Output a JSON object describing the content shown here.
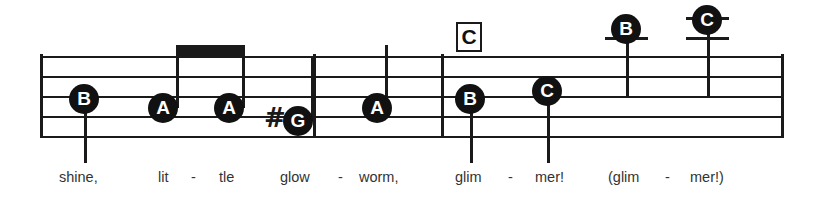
{
  "score": {
    "staff": {
      "left": 40,
      "right": 783,
      "line_ys": [
        56,
        76,
        96,
        116,
        136
      ],
      "line_color": "#1a1a1a"
    },
    "barlines": [
      {
        "name": "barline-start",
        "x": 40,
        "top": 54,
        "bottom": 138
      },
      {
        "name": "barline-1",
        "x": 313,
        "top": 54,
        "bottom": 138
      },
      {
        "name": "barline-2",
        "x": 441,
        "top": 54,
        "bottom": 138
      },
      {
        "name": "barline-end",
        "x": 781,
        "top": 54,
        "bottom": 138
      }
    ],
    "chord_symbols": [
      {
        "label": "C",
        "x": 456,
        "y": 22,
        "width": 26,
        "height": 30
      }
    ],
    "notes": [
      {
        "id": "note-1",
        "letter": "B",
        "head_x": 69,
        "head_y": 84,
        "stem_x": 84,
        "stem_top": 99,
        "stem_bottom": 163,
        "stem_dir": "down",
        "accidental": "",
        "ledger_lines": []
      },
      {
        "id": "note-2",
        "letter": "A",
        "head_x": 148,
        "head_y": 93,
        "stem_x": 176,
        "stem_top": 45,
        "stem_bottom": 108,
        "stem_dir": "up",
        "accidental": "",
        "ledger_lines": []
      },
      {
        "id": "note-3",
        "letter": "A",
        "head_x": 214,
        "head_y": 93,
        "stem_x": 242,
        "stem_top": 45,
        "stem_bottom": 108,
        "stem_dir": "up",
        "accidental": "",
        "ledger_lines": []
      },
      {
        "id": "note-4",
        "letter": "G",
        "head_x": 283,
        "head_y": 106,
        "stem_x": 311,
        "stem_top": 58,
        "stem_bottom": 121,
        "stem_dir": "up",
        "accidental": "#",
        "accidental_x": 264,
        "accidental_y": 105,
        "ledger_lines": []
      },
      {
        "id": "note-5",
        "letter": "A",
        "head_x": 362,
        "head_y": 93,
        "stem_x": 385,
        "stem_top": 45,
        "stem_bottom": 108,
        "stem_dir": "up",
        "accidental": "",
        "ledger_lines": []
      },
      {
        "id": "note-6",
        "letter": "B",
        "head_x": 455,
        "head_y": 84,
        "stem_x": 470,
        "stem_top": 99,
        "stem_bottom": 163,
        "stem_dir": "down",
        "accidental": "",
        "ledger_lines": []
      },
      {
        "id": "note-7",
        "letter": "C",
        "head_x": 532,
        "head_y": 76,
        "stem_x": 547,
        "stem_top": 91,
        "stem_bottom": 163,
        "stem_dir": "down",
        "accidental": "",
        "ledger_lines": []
      },
      {
        "id": "note-8",
        "letter": "B",
        "head_x": 611,
        "head_y": 14,
        "stem_x": 626,
        "stem_top": 29,
        "stem_bottom": 97,
        "stem_dir": "down",
        "accidental": "",
        "ledger_lines": [
          {
            "x": 605,
            "y": 37,
            "width": 43
          }
        ]
      },
      {
        "id": "note-9",
        "letter": "C",
        "head_x": 692,
        "head_y": 5,
        "stem_x": 707,
        "stem_top": 20,
        "stem_bottom": 97,
        "stem_dir": "down",
        "accidental": "",
        "ledger_lines": [
          {
            "x": 686,
            "y": 17,
            "width": 43
          },
          {
            "x": 686,
            "y": 37,
            "width": 43
          }
        ]
      }
    ],
    "beams": [
      {
        "x": 176,
        "y": 45,
        "width": 69,
        "height": 11
      }
    ],
    "lyrics": [
      {
        "text": "shine,",
        "x": 59,
        "y": 169
      },
      {
        "text": "lit",
        "x": 158,
        "y": 169
      },
      {
        "text": "-",
        "x": 191,
        "y": 169
      },
      {
        "text": "tle",
        "x": 219,
        "y": 169
      },
      {
        "text": "glow",
        "x": 280,
        "y": 169
      },
      {
        "text": "-",
        "x": 338,
        "y": 169
      },
      {
        "text": "worm,",
        "x": 359,
        "y": 169
      },
      {
        "text": "glim",
        "x": 455,
        "y": 169
      },
      {
        "text": "-",
        "x": 508,
        "y": 169
      },
      {
        "text": "mer!",
        "x": 535,
        "y": 169
      },
      {
        "text": "(glim",
        "x": 608,
        "y": 169
      },
      {
        "text": "-",
        "x": 665,
        "y": 169
      },
      {
        "text": "mer!)",
        "x": 690,
        "y": 169
      }
    ]
  }
}
